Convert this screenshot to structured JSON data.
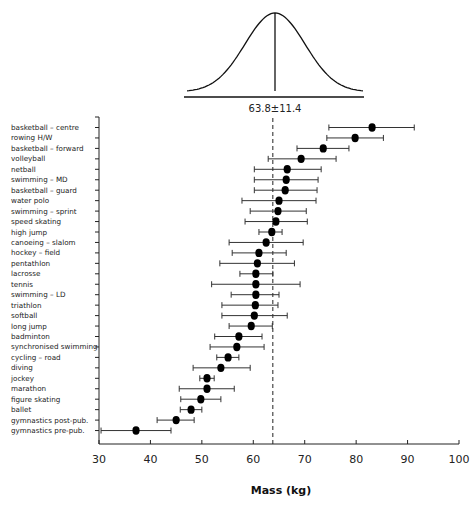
{
  "chart_data": {
    "type": "scatter",
    "subtype": "dot-with-error-bars",
    "title": "",
    "xlabel": "Mass (kg)",
    "ylabel": "",
    "xlim": [
      30,
      100
    ],
    "xticks": [
      30,
      40,
      50,
      60,
      70,
      80,
      90,
      100
    ],
    "grid": false,
    "legend": null,
    "reference_line": {
      "value": 63.8,
      "style": "dashed"
    },
    "distribution_inset": {
      "type": "normal-curve",
      "label": "63.8±11.4",
      "mean": 63.8,
      "sd": 11.4
    },
    "categories": [
      "basketball – centre",
      "rowing H/W",
      "basketball – forward",
      "volleyball",
      "netball",
      "swimming – MD",
      "basketball – guard",
      "water polo",
      "swimming – sprint",
      "speed skating",
      "high jump",
      "canoeing – slalom",
      "hockey – field",
      "pentathlon",
      "lacrosse",
      "tennis",
      "swimming – LD",
      "triathlon",
      "softball",
      "long jump",
      "badminton",
      "synchronised swimming",
      "cycling – road",
      "diving",
      "jockey",
      "marathon",
      "figure skating",
      "ballet",
      "gymnastics post-pub.",
      "gymnastics pre-pub."
    ],
    "series": [
      {
        "name": "mean mass",
        "values": [
          83.1,
          79.8,
          73.6,
          69.3,
          66.6,
          66.4,
          66.2,
          65.0,
          64.8,
          64.4,
          63.6,
          62.5,
          61.1,
          60.8,
          60.5,
          60.5,
          60.5,
          60.4,
          60.2,
          59.6,
          57.2,
          56.8,
          55.1,
          53.7,
          51.0,
          51.0,
          49.8,
          47.9,
          45.0,
          37.2
        ],
        "lower": [
          74.7,
          74.3,
          68.5,
          62.9,
          60.2,
          60.2,
          60.2,
          57.8,
          59.4,
          58.4,
          61.1,
          55.3,
          55.9,
          53.5,
          57.4,
          51.9,
          55.7,
          53.9,
          53.9,
          55.3,
          52.5,
          51.6,
          52.9,
          48.3,
          49.6,
          45.6,
          45.9,
          45.8,
          41.3,
          30.4
        ],
        "upper": [
          91.3,
          85.3,
          78.6,
          76.1,
          73.2,
          72.6,
          72.4,
          72.2,
          70.3,
          70.5,
          65.6,
          69.7,
          66.4,
          68.0,
          63.8,
          69.1,
          65.0,
          64.8,
          66.6,
          63.7,
          61.7,
          62.1,
          57.2,
          59.4,
          52.4,
          56.3,
          53.7,
          50.0,
          48.5,
          44.0
        ]
      }
    ]
  },
  "axis": {
    "x_label": "Mass (kg)"
  }
}
